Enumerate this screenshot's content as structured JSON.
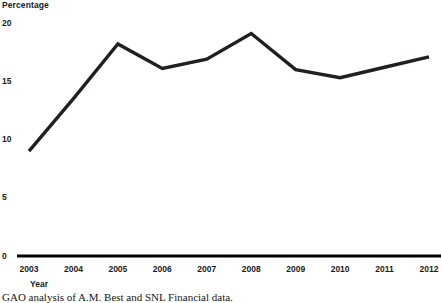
{
  "chart_data": {
    "type": "line",
    "title": "",
    "xlabel": "Year",
    "ylabel": "Percentage",
    "categories": [
      "2003",
      "2004",
      "2005",
      "2006",
      "2007",
      "2008",
      "2009",
      "2010",
      "2011",
      "2012"
    ],
    "values": [
      9.0,
      13.5,
      18.2,
      16.1,
      16.9,
      19.1,
      16.0,
      15.3,
      16.2,
      17.1
    ],
    "series": [
      {
        "name": "Percentage",
        "values": [
          9.0,
          13.5,
          18.2,
          16.1,
          16.9,
          19.1,
          16.0,
          15.3,
          16.2,
          17.1
        ]
      }
    ],
    "ylim": [
      0,
      20
    ],
    "y_ticks": [
      "0",
      "5",
      "10",
      "15",
      "20"
    ],
    "y_tick_values": [
      0,
      5,
      10,
      15,
      20
    ],
    "x_ticks": [
      "2003",
      "2004",
      "2005",
      "2006",
      "2007",
      "2008",
      "2009",
      "2010",
      "2011",
      "2012"
    ],
    "grid": false,
    "legend": "none",
    "line_color": "#231f20",
    "axis_color": "#000000"
  },
  "axes": {
    "y_title": "Percentage",
    "x_title": "Year"
  },
  "source": {
    "note": "GAO analysis of A.M. Best and SNL Financial data."
  }
}
